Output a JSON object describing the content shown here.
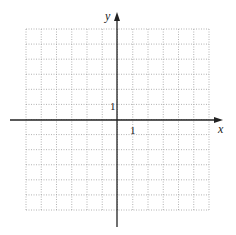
{
  "graph": {
    "x_axis_label": "x",
    "y_axis_label": "y",
    "x_tick_label": "1",
    "y_tick_label": "1",
    "grid": {
      "x_min": -6,
      "x_max": 6,
      "y_min": -6,
      "y_max": 6,
      "cells_x": 12,
      "cells_y": 12,
      "style": "dotted"
    },
    "colors": {
      "axis": "#222222",
      "grid": "#a0a0a0",
      "background": "#ffffff"
    }
  }
}
